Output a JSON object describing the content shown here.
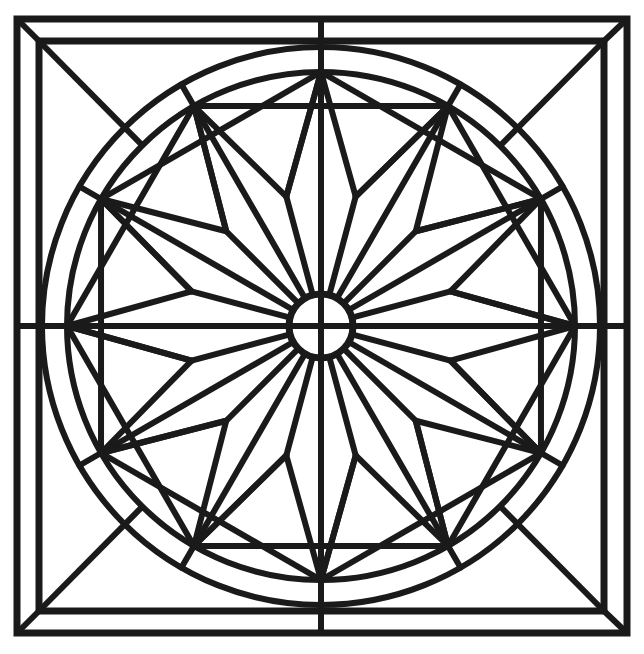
{
  "artwork": {
    "title": "Geometric Rosette Window Pattern",
    "kind": "line-art-coloring-page",
    "canvas": {
      "width": 644,
      "height": 654
    },
    "ink_color": "#1a1a1a",
    "background_color": "#ffffff"
  },
  "geometry": {
    "center": {
      "x": 321,
      "y": 326
    },
    "outer_square": {
      "x1": 17,
      "y1": 19,
      "x2": 627,
      "y2": 633,
      "stroke": 7
    },
    "inner_square": {
      "x1": 39,
      "y1": 41,
      "x2": 604,
      "y2": 611,
      "stroke": 7
    },
    "corner_diagonals": [
      {
        "x1": 17,
        "y1": 19,
        "x2": 39,
        "y2": 41
      },
      {
        "x1": 627,
        "y1": 19,
        "x2": 604,
        "y2": 41
      },
      {
        "x1": 17,
        "y1": 633,
        "x2": 39,
        "y2": 611
      },
      {
        "x1": 627,
        "y1": 633,
        "x2": 604,
        "y2": 611
      }
    ],
    "outer_circle": {
      "cx": 321,
      "cy": 326,
      "r": 279,
      "stroke": 6
    },
    "inner_circle": {
      "cx": 321,
      "cy": 326,
      "r": 254,
      "stroke": 6
    },
    "hub_circle": {
      "cx": 321,
      "cy": 326,
      "r": 32,
      "stroke": 7
    },
    "star": {
      "points": 12,
      "tip_radius": 254,
      "valley_radius": 134,
      "tip_angles_deg": [
        270,
        300,
        330,
        0,
        30,
        60,
        90,
        120,
        150,
        180,
        210,
        240
      ],
      "valley_angles_deg": [
        285,
        315,
        345,
        15,
        45,
        75,
        105,
        135,
        165,
        195,
        225,
        255
      ],
      "stroke": 6
    },
    "spokes": {
      "count": 12,
      "angles_deg": [
        270,
        300,
        330,
        0,
        30,
        60,
        90,
        120,
        150,
        180,
        210,
        240
      ],
      "from_radius": 32,
      "to_radius": 279,
      "stroke": 6
    },
    "cross_axes": {
      "horizontal": {
        "y": 326,
        "x1": 17,
        "x2": 627
      },
      "vertical": {
        "x": 321,
        "y1": 19,
        "y2": 633
      },
      "stroke": 6
    },
    "corner_rays": {
      "description": "square-corner diagonals running to the inner circle",
      "stroke": 6
    },
    "chord_web": {
      "description": "chords linking adjacent star tips through the valley vertices",
      "stroke": 6
    }
  },
  "labels": {
    "region_names": [
      "outer-frame",
      "inner-frame",
      "outer-ring",
      "inner-ring",
      "twelve-point-star",
      "center-hub"
    ]
  }
}
